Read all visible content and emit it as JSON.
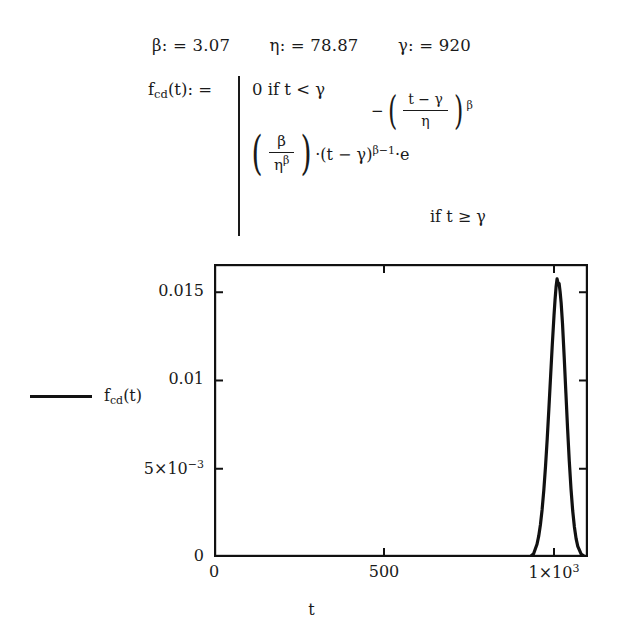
{
  "parameters": [
    {
      "symbol": "β",
      "assign": ": =",
      "value": "3.07"
    },
    {
      "symbol": "η",
      "assign": ": =",
      "value": "78.87"
    },
    {
      "symbol": "γ",
      "assign": ": =",
      "value": "920"
    }
  ],
  "definition": {
    "function_name": "f",
    "function_sub": "cd",
    "function_arg": "(t): =",
    "case1": "0 if t < γ",
    "case2": {
      "numerator": "β",
      "denominator": "η",
      "denominator_exp": "β",
      "factor": "·(t − γ)",
      "factor_exp": "β−1",
      "times_e": "·e",
      "exponent_minus": "−",
      "exponent_num": "t − γ",
      "exponent_den": "η",
      "exponent_pow": "β",
      "condition": "if t ≥ γ"
    }
  },
  "legend": {
    "label_main": "f",
    "label_sub": "cd",
    "label_tail": "(t)",
    "color": "#111111"
  },
  "chart_data": {
    "type": "line",
    "title": "",
    "xlabel": "t",
    "ylabel": "",
    "xlim": [
      0,
      1100
    ],
    "ylim": [
      0,
      0.0166
    ],
    "grid": false,
    "legend_position": "outside-left",
    "line_color": "#111111",
    "xticks": [
      {
        "value": 0,
        "label": "0"
      },
      {
        "value": 500,
        "label": "500"
      },
      {
        "value": 1000,
        "label": "1×10³"
      }
    ],
    "yticks": [
      {
        "value": 0,
        "label": "0"
      },
      {
        "value": 0.005,
        "label": "5×10⁻³"
      },
      {
        "value": 0.01,
        "label": "0.01"
      },
      {
        "value": 0.015,
        "label": "0.015"
      }
    ],
    "series": [
      {
        "name": "f_cd(t)",
        "x": [
          0,
          100,
          200,
          300,
          400,
          500,
          600,
          700,
          800,
          900,
          920,
          930,
          940,
          950,
          955,
          960,
          965,
          970,
          975,
          980,
          985,
          990,
          995,
          1000,
          1003,
          1006,
          1009,
          1012,
          1015,
          1018,
          1021,
          1025,
          1030,
          1035,
          1040,
          1045,
          1050,
          1055,
          1060,
          1065,
          1070,
          1080,
          1090,
          1100
        ],
        "y": [
          0,
          0,
          0,
          0,
          0,
          0,
          0,
          0,
          0,
          0,
          0,
          2e-05,
          0.00018,
          0.00072,
          0.00118,
          0.00182,
          0.00268,
          0.00378,
          0.00512,
          0.00668,
          0.00842,
          0.01024,
          0.01204,
          0.01368,
          0.01455,
          0.01528,
          0.01576,
          0.01552,
          0.0155,
          0.01502,
          0.0144,
          0.01322,
          0.01132,
          0.00928,
          0.00726,
          0.00542,
          0.00386,
          0.00262,
          0.0017,
          0.00104,
          0.0006,
          0.00016,
          3e-05,
          0
        ]
      }
    ]
  }
}
